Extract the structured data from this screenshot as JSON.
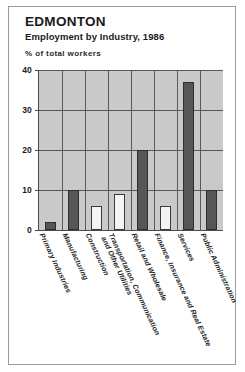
{
  "header": {
    "title": "EDMONTON",
    "subtitle": "Employment by Industry, 1986"
  },
  "chart_data": {
    "type": "bar",
    "title": "EDMONTON",
    "subtitle": "Employment by Industry, 1986",
    "xlabel": "",
    "ylabel": "% of total workers",
    "ylim": [
      0,
      40
    ],
    "yticks": [
      0,
      10,
      20,
      30,
      40
    ],
    "grid": true,
    "legend": "none",
    "categories": [
      "Primary Industries",
      "Manufacturing",
      "Construction",
      "Transportation, Communication\nand Other Utilities",
      "Retail and Wholesale",
      "Finance, Insurance and Real Estate",
      "Services",
      "Public Administration"
    ],
    "values": [
      2,
      10,
      6,
      9,
      20,
      6,
      37,
      10
    ],
    "bar_styles": [
      "dark",
      "dark",
      "light",
      "light",
      "dark",
      "light",
      "dark",
      "dark"
    ],
    "colors": {
      "plot_background": "#c9c9c9",
      "bar_dark": "#565656",
      "bar_light": "#f4f4f4",
      "axis": "#4a4a4a",
      "gridline": "#5a5a5a",
      "text": "#1a1a1a",
      "frame": "#9a9a9a"
    }
  }
}
